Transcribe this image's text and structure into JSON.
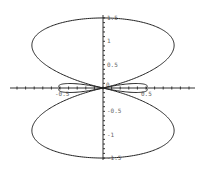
{
  "chart_data": {
    "type": "line",
    "title": "",
    "xlabel": "",
    "ylabel": "",
    "curve": "polar curve, symmetric about both axes; two large lobes (top and bottom) with two small inner loops on the x-axis",
    "x_ticks": [
      "-0.5",
      "0.5"
    ],
    "y_ticks": [
      "1.5",
      "1",
      "0.5",
      "0",
      "-0.5",
      "-1",
      "-1.5"
    ],
    "xlim": [
      -1.1,
      1.1
    ],
    "ylim": [
      -1.5,
      1.5
    ],
    "key_points": {
      "top": [
        0,
        1.5
      ],
      "bottom": [
        0,
        -1.5
      ],
      "self_intersection_right": [
        0.8,
        0
      ],
      "self_intersection_left": [
        -0.8,
        0
      ],
      "inner_loop_tip_right": [
        0.5,
        0
      ],
      "inner_loop_tip_left": [
        -0.5,
        0
      ],
      "max_width_x": 1.0,
      "max_width_at_y": 0.6
    },
    "grid": false,
    "legend": false
  },
  "axes": {
    "x_labels": [
      {
        "text": "-0.5",
        "value": -0.5
      },
      {
        "text": "0.5",
        "value": 0.5
      }
    ],
    "y_labels": [
      {
        "text": "1.5",
        "value": 1.5
      },
      {
        "text": "1",
        "value": 1
      },
      {
        "text": "0.5",
        "value": 0.5
      },
      {
        "text": "0",
        "value": 0
      },
      {
        "text": "-0.5",
        "value": -0.5
      },
      {
        "text": "-1",
        "value": -1
      },
      {
        "text": "-1.5",
        "value": -1.5
      }
    ]
  },
  "colors": {
    "curve": "#222222",
    "axis": "#333333",
    "labels": "#777777"
  }
}
